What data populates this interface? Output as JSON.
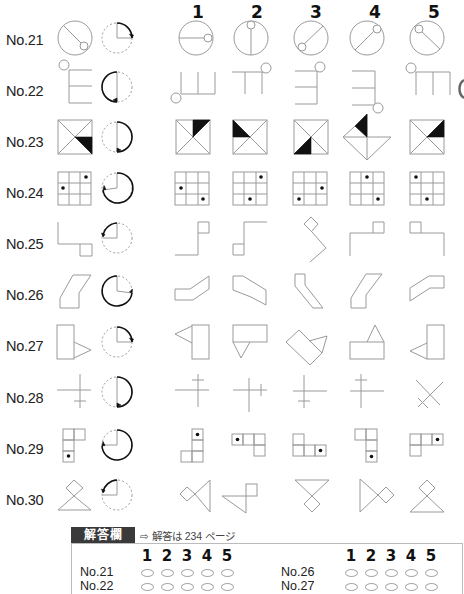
{
  "columns": [
    "1",
    "2",
    "3",
    "4",
    "5"
  ],
  "rows": [
    {
      "label": "No.21",
      "example": "circle-with-line-and-small-circle",
      "rotation": "quarter-turn-clockwise"
    },
    {
      "label": "No.22",
      "example": "comb-shape-with-circle",
      "rotation": "half-turn-counterclockwise"
    },
    {
      "label": "No.23",
      "example": "square-with-diagonals-black-triangle",
      "rotation": "half-turn-clockwise"
    },
    {
      "label": "No.24",
      "example": "3x3-grid-with-two-dots",
      "rotation": "three-quarter-turn-clockwise"
    },
    {
      "label": "No.25",
      "example": "step-shape-with-small-square",
      "rotation": "quarter-turn-counterclockwise"
    },
    {
      "label": "No.26",
      "example": "parallelogram-bent-shape",
      "rotation": "three-quarter-turn-clockwise"
    },
    {
      "label": "No.27",
      "example": "rectangle-with-triangle",
      "rotation": "quarter-turn-clockwise"
    },
    {
      "label": "No.28",
      "example": "cross-with-tick",
      "rotation": "half-turn-clockwise"
    },
    {
      "label": "No.29",
      "example": "l-tromino-with-dot",
      "rotation": "three-quarter-turn-clockwise"
    },
    {
      "label": "No.30",
      "example": "diamond-over-triangle",
      "rotation": "quarter-turn-counterclockwise"
    }
  ],
  "answer_sheet": {
    "tab_label": "解答欄",
    "reference": "⇨ 解答は 234 ページ",
    "choice_numbers": [
      "1",
      "2",
      "3",
      "4",
      "5"
    ],
    "left_rows": [
      "No.21",
      "No.22"
    ],
    "right_rows": [
      "No.26",
      "No.27"
    ]
  }
}
